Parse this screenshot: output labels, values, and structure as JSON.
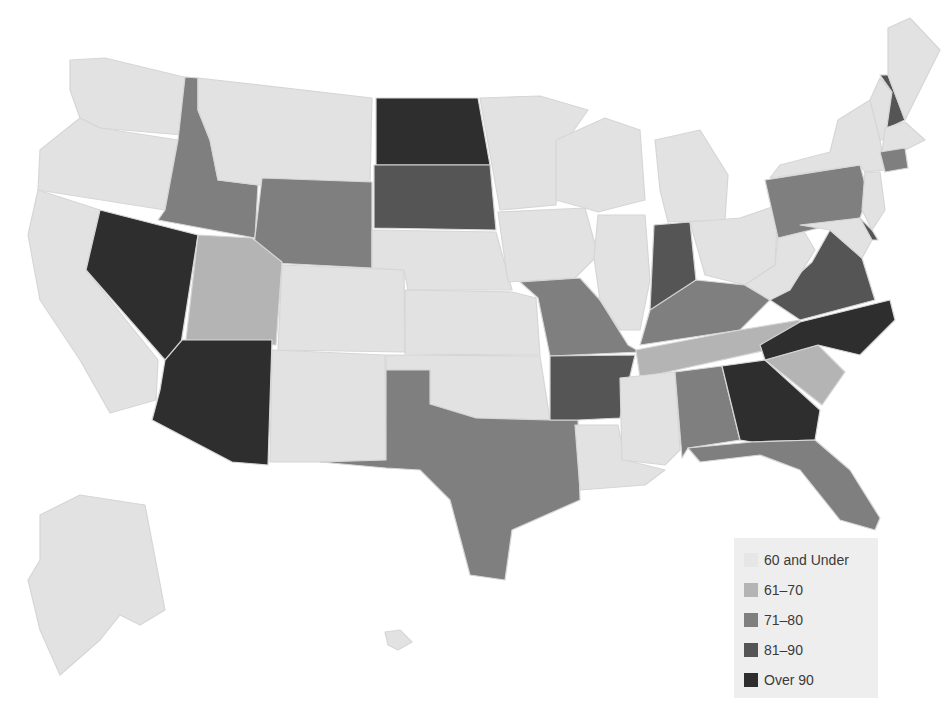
{
  "map": {
    "type": "choropleth",
    "region": "United States",
    "colors": {
      "60 and Under": "#e2e2e2",
      "61-70": "#b4b4b4",
      "71-80": "#7f7f7f",
      "81-90": "#555555",
      "Over 90": "#2e2e2e"
    }
  },
  "legend": {
    "items": [
      {
        "label": "60 and Under",
        "color": "#e2e2e2"
      },
      {
        "label": "61–70",
        "color": "#b4b4b4"
      },
      {
        "label": "71–80",
        "color": "#7f7f7f"
      },
      {
        "label": "81–90",
        "color": "#555555"
      },
      {
        "label": "Over 90",
        "color": "#2e2e2e"
      }
    ]
  },
  "states": [
    {
      "name": "Washington",
      "bin": "60 and Under"
    },
    {
      "name": "Oregon",
      "bin": "60 and Under"
    },
    {
      "name": "California",
      "bin": "60 and Under"
    },
    {
      "name": "Nevada",
      "bin": "Over 90"
    },
    {
      "name": "Idaho",
      "bin": "71-80"
    },
    {
      "name": "Montana",
      "bin": "60 and Under"
    },
    {
      "name": "Wyoming",
      "bin": "71-80"
    },
    {
      "name": "Utah",
      "bin": "61-70"
    },
    {
      "name": "Arizona",
      "bin": "Over 90"
    },
    {
      "name": "Colorado",
      "bin": "60 and Under"
    },
    {
      "name": "New Mexico",
      "bin": "60 and Under"
    },
    {
      "name": "North Dakota",
      "bin": "Over 90"
    },
    {
      "name": "South Dakota",
      "bin": "81-90"
    },
    {
      "name": "Nebraska",
      "bin": "60 and Under"
    },
    {
      "name": "Kansas",
      "bin": "60 and Under"
    },
    {
      "name": "Oklahoma",
      "bin": "60 and Under"
    },
    {
      "name": "Texas",
      "bin": "71-80"
    },
    {
      "name": "Minnesota",
      "bin": "60 and Under"
    },
    {
      "name": "Iowa",
      "bin": "60 and Under"
    },
    {
      "name": "Missouri",
      "bin": "71-80"
    },
    {
      "name": "Arkansas",
      "bin": "81-90"
    },
    {
      "name": "Louisiana",
      "bin": "60 and Under"
    },
    {
      "name": "Wisconsin",
      "bin": "60 and Under"
    },
    {
      "name": "Illinois",
      "bin": "60 and Under"
    },
    {
      "name": "Michigan",
      "bin": "60 and Under"
    },
    {
      "name": "Indiana",
      "bin": "81-90"
    },
    {
      "name": "Ohio",
      "bin": "60 and Under"
    },
    {
      "name": "Kentucky",
      "bin": "71-80"
    },
    {
      "name": "Tennessee",
      "bin": "61-70"
    },
    {
      "name": "Mississippi",
      "bin": "60 and Under"
    },
    {
      "name": "Alabama",
      "bin": "71-80"
    },
    {
      "name": "Georgia",
      "bin": "Over 90"
    },
    {
      "name": "Florida",
      "bin": "71-80"
    },
    {
      "name": "South Carolina",
      "bin": "61-70"
    },
    {
      "name": "North Carolina",
      "bin": "Over 90"
    },
    {
      "name": "Virginia",
      "bin": "81-90"
    },
    {
      "name": "West Virginia",
      "bin": "60 and Under"
    },
    {
      "name": "Pennsylvania",
      "bin": "71-80"
    },
    {
      "name": "New York",
      "bin": "60 and Under"
    },
    {
      "name": "Vermont",
      "bin": "60 and Under"
    },
    {
      "name": "New Hampshire",
      "bin": "81-90"
    },
    {
      "name": "Maine",
      "bin": "60 and Under"
    },
    {
      "name": "Massachusetts",
      "bin": "60 and Under"
    },
    {
      "name": "Connecticut",
      "bin": "71-80"
    },
    {
      "name": "New Jersey",
      "bin": "60 and Under"
    },
    {
      "name": "Delaware",
      "bin": "81-90"
    },
    {
      "name": "Maryland",
      "bin": "60 and Under"
    },
    {
      "name": "Alaska",
      "bin": "60 and Under"
    },
    {
      "name": "Hawaii",
      "bin": "60 and Under"
    }
  ]
}
